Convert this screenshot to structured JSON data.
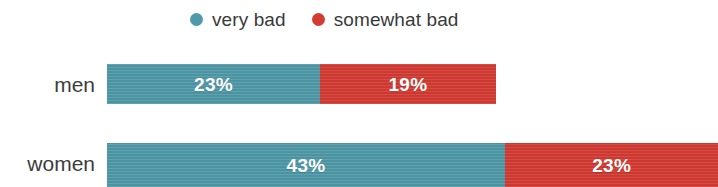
{
  "chart_data": {
    "type": "bar",
    "orientation": "horizontal",
    "stacked": true,
    "title": "",
    "subtitle": "",
    "xlabel": "",
    "ylabel": "",
    "grid": false,
    "legend_position": "top",
    "categories": [
      "men",
      "women"
    ],
    "series": [
      {
        "name": "very bad",
        "color": "#4f9aa8",
        "values": [
          23,
          43
        ],
        "labels": [
          "23%",
          "19%"
        ]
      },
      {
        "name": "somewhat bad",
        "color": "#d43b33",
        "values": [
          19,
          23
        ],
        "labels": [
          "19%",
          "23%"
        ]
      }
    ],
    "data_labels": [
      [
        "23%",
        "19%"
      ],
      [
        "43%",
        "23%"
      ]
    ],
    "note": "values are percentages; women row extends past the right edge of the frame"
  },
  "legend": {
    "items": [
      {
        "label": "very bad",
        "color": "#4f9aa8",
        "marker": "circle"
      },
      {
        "label": "somewhat bad",
        "color": "#d43b33",
        "marker": "circle"
      }
    ]
  },
  "rows": [
    {
      "label": "men",
      "segments": [
        {
          "series": "very bad",
          "value": "23%",
          "color": "#4f9aa8"
        },
        {
          "series": "somewhat bad",
          "value": "19%",
          "color": "#d43b33"
        }
      ]
    },
    {
      "label": "women",
      "segments": [
        {
          "series": "very bad",
          "value": "43%",
          "color": "#4f9aa8"
        },
        {
          "series": "somewhat bad",
          "value": "23%",
          "color": "#d43b33"
        }
      ]
    }
  ],
  "colors": {
    "very_bad": "#4f9aa8",
    "somewhat_bad": "#d43b33",
    "text": "#3d3d3d",
    "value_text": "#ffffff",
    "background": "#ffffff"
  }
}
